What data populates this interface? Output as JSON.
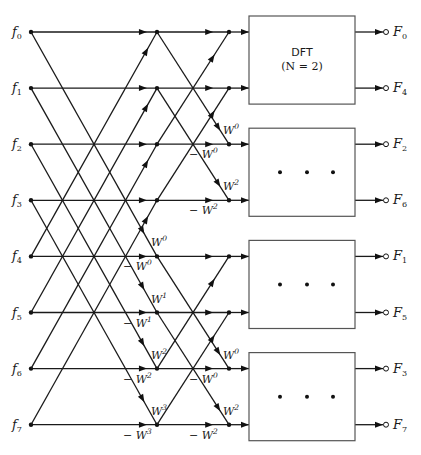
{
  "diagram": {
    "inputs": [
      "f0",
      "f1",
      "f2",
      "f3",
      "f4",
      "f5",
      "f6",
      "f7"
    ],
    "input_labels": [
      {
        "base": "f",
        "sub": "0"
      },
      {
        "base": "f",
        "sub": "1"
      },
      {
        "base": "f",
        "sub": "2"
      },
      {
        "base": "f",
        "sub": "3"
      },
      {
        "base": "f",
        "sub": "4"
      },
      {
        "base": "f",
        "sub": "5"
      },
      {
        "base": "f",
        "sub": "6"
      },
      {
        "base": "f",
        "sub": "7"
      }
    ],
    "output_labels": [
      {
        "base": "F",
        "sub": "0"
      },
      {
        "base": "F",
        "sub": "4"
      },
      {
        "base": "F",
        "sub": "2"
      },
      {
        "base": "F",
        "sub": "6"
      },
      {
        "base": "F",
        "sub": "1"
      },
      {
        "base": "F",
        "sub": "5"
      },
      {
        "base": "F",
        "sub": "3"
      },
      {
        "base": "F",
        "sub": "7"
      }
    ],
    "stage1_weights": [
      {
        "row": 4,
        "diag": "0",
        "horiz": "0"
      },
      {
        "row": 5,
        "diag": "1",
        "horiz": "1"
      },
      {
        "row": 6,
        "diag": "2",
        "horiz": "2"
      },
      {
        "row": 7,
        "diag": "3",
        "horiz": "3"
      }
    ],
    "stage2_weights": [
      {
        "row": 2,
        "diag": "0",
        "horiz": "0"
      },
      {
        "row": 3,
        "diag": "2",
        "horiz": "2"
      },
      {
        "row": 6,
        "diag": "0",
        "horiz": "0"
      },
      {
        "row": 7,
        "diag": "2",
        "horiz": "2"
      }
    ],
    "weight_symbol": "W",
    "neg_prefix": "−",
    "boxes": [
      {
        "rows": [
          0,
          1
        ],
        "line1": "DFT",
        "line2": "(N = 2)",
        "dots": false
      },
      {
        "rows": [
          2,
          3
        ],
        "line1": "",
        "line2": "",
        "dots": true
      },
      {
        "rows": [
          4,
          5
        ],
        "line1": "",
        "line2": "",
        "dots": true
      },
      {
        "rows": [
          6,
          7
        ],
        "line1": "",
        "line2": "",
        "dots": true
      }
    ],
    "colors": {
      "line": "#1a1a1a",
      "box_border": "#555555",
      "background": "#ffffff"
    }
  }
}
